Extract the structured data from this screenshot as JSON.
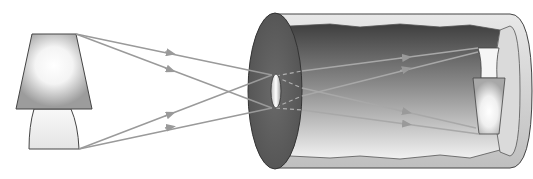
{
  "diagram": {
    "colors": {
      "background": "#ffffff",
      "ray": "#9a9a9a",
      "outline": "#333333",
      "front_face": "#5e5e5e",
      "interior_dark": "#4a4a4a",
      "interior_light": "#f2f2f2",
      "back_screen": "#dcdcdc",
      "lamp_glow": "#ffffff",
      "lamp_shade": "#9a9a9a"
    },
    "elements": [
      {
        "name": "lamp-object",
        "role": "light source / object"
      },
      {
        "name": "light-rays",
        "count": 4
      },
      {
        "name": "camera-box",
        "role": "cylindrical camera body"
      },
      {
        "name": "pinhole-aperture",
        "role": "small hole in front face"
      },
      {
        "name": "inverted-image",
        "role": "upside-down lamp projected on back screen"
      }
    ]
  }
}
